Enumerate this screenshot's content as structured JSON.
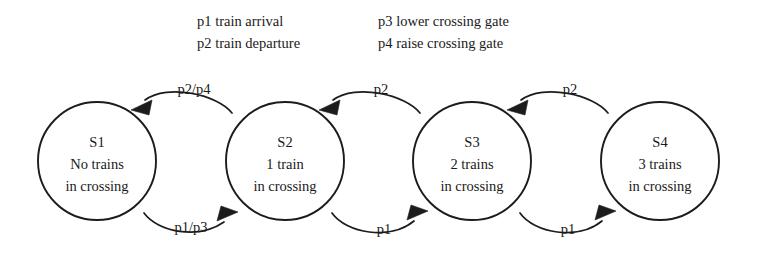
{
  "diagram": {
    "type": "finite-state-machine",
    "title": "",
    "background_color": "#ffffff",
    "stroke_color": "#1c1c1c",
    "text_color": "#1a1a1a"
  },
  "legend": {
    "columns": [
      {
        "entries": [
          {
            "code": "p1",
            "description": "train arrival",
            "text": "p1 train arrival"
          },
          {
            "code": "p2",
            "description": "train departure",
            "text": "p2 train departure"
          }
        ]
      },
      {
        "entries": [
          {
            "code": "p3",
            "description": "lower crossing gate",
            "text": "p3 lower crossing gate"
          },
          {
            "code": "p4",
            "description": "raise crossing gate",
            "text": "p4 raise crossing gate"
          }
        ]
      }
    ]
  },
  "states": [
    {
      "id": "S1",
      "line1": "No trains",
      "line2": "in crossing",
      "cx": 97,
      "cy": 161,
      "r": 59
    },
    {
      "id": "S2",
      "line1": "1 train",
      "line2": "in crossing",
      "cx": 285,
      "cy": 161,
      "r": 59
    },
    {
      "id": "S3",
      "line1": "2 trains",
      "line2": "in crossing",
      "cx": 472,
      "cy": 161,
      "r": 59
    },
    {
      "id": "S4",
      "line1": "3 trains",
      "line2": "in crossing",
      "cx": 660,
      "cy": 161,
      "r": 59
    }
  ],
  "transitions": [
    {
      "from": "S2",
      "to": "S1",
      "label": "p2/p4",
      "direction": "backward",
      "label_x": 194,
      "label_y": 94
    },
    {
      "from": "S1",
      "to": "S2",
      "label": "p1/p3",
      "direction": "forward",
      "label_x": 191,
      "label_y": 232
    },
    {
      "from": "S3",
      "to": "S2",
      "label": "p2",
      "direction": "backward",
      "label_x": 381,
      "label_y": 94
    },
    {
      "from": "S2",
      "to": "S3",
      "label": "p1",
      "direction": "forward",
      "label_x": 384,
      "label_y": 234
    },
    {
      "from": "S4",
      "to": "S3",
      "label": "p2",
      "direction": "backward",
      "label_x": 570,
      "label_y": 94
    },
    {
      "from": "S3",
      "to": "S4",
      "label": "p1",
      "direction": "forward",
      "label_x": 568,
      "label_y": 234
    }
  ]
}
